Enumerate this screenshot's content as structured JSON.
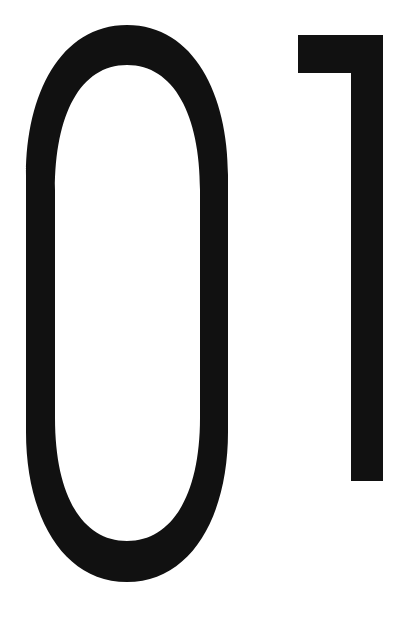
{
  "display": {
    "text": "01",
    "digits": [
      "0",
      "1"
    ],
    "foreground_color": "#111111",
    "background_color": "#ffffff"
  }
}
